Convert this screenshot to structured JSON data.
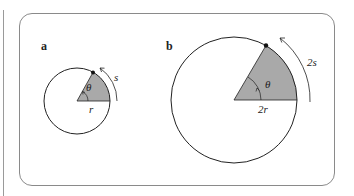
{
  "figure": {
    "panels": [
      {
        "label": "a",
        "radius_label": "r",
        "arc_label": "s",
        "angle_label": "θ"
      },
      {
        "label": "b",
        "radius_label": "2r",
        "arc_label": "2s",
        "angle_label": "θ"
      }
    ],
    "colors": {
      "sector_fill": "#a9a9a9",
      "stroke": "#222222",
      "frame": "#8a8a8a"
    }
  }
}
